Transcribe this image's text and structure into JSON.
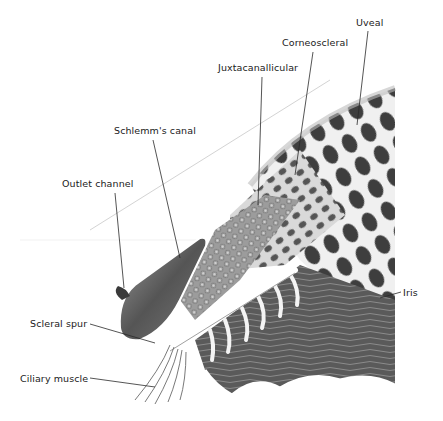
{
  "figure": {
    "labels": {
      "uveal": "Uveal",
      "corneoscleral": "Corneoscleral",
      "juxtacanallicular": "Juxtacanallicular",
      "schlemms_canal": "Schlemm's canal",
      "outlet_channel": "Outlet channel",
      "scleral_spur": "Scleral spur",
      "ciliary_muscle": "Ciliary muscle",
      "iris": "Iris"
    },
    "colors": {
      "background": "#ffffff",
      "ink": "#1a1a1a",
      "tissue_dark": "#3c3c3c",
      "tissue_mid": "#8a8a8a",
      "tissue_light": "#d6d6d6",
      "strand": "#f2f2f2"
    }
  }
}
